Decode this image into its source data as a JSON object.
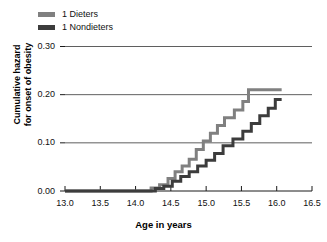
{
  "chart_data": {
    "type": "line",
    "subtype": "step",
    "title": "",
    "xlabel": "Age in years",
    "ylabel": "Cumulative hazard for onset of obesity",
    "ylabel_lines": [
      "Cumulative hazard",
      "for onset of obesity"
    ],
    "xlim": [
      13.0,
      16.5
    ],
    "ylim": [
      0.0,
      0.3
    ],
    "xticks": [
      13.0,
      13.5,
      14.0,
      14.5,
      15.0,
      15.5,
      16.0,
      16.5
    ],
    "xtick_labels": [
      "13.0",
      "13.5",
      "14.0",
      "14.5",
      "15.0",
      "15.5",
      "16.0",
      "16.5"
    ],
    "yticks": [
      0.0,
      0.1,
      0.2,
      0.3
    ],
    "ytick_labels": [
      "0.00",
      "0.10",
      "0.20",
      "0.30"
    ],
    "grid": "horizontal",
    "legend_position": "above-left",
    "series": [
      {
        "name": "1 Dieters",
        "color": "#808080",
        "points": [
          [
            13.0,
            0.0
          ],
          [
            14.22,
            0.0
          ],
          [
            14.22,
            0.006
          ],
          [
            14.34,
            0.006
          ],
          [
            14.34,
            0.013
          ],
          [
            14.46,
            0.013
          ],
          [
            14.46,
            0.026
          ],
          [
            14.56,
            0.026
          ],
          [
            14.56,
            0.04
          ],
          [
            14.66,
            0.04
          ],
          [
            14.66,
            0.052
          ],
          [
            14.76,
            0.052
          ],
          [
            14.76,
            0.066
          ],
          [
            14.86,
            0.066
          ],
          [
            14.86,
            0.086
          ],
          [
            14.96,
            0.086
          ],
          [
            14.96,
            0.104
          ],
          [
            15.06,
            0.104
          ],
          [
            15.06,
            0.12
          ],
          [
            15.16,
            0.12
          ],
          [
            15.16,
            0.136
          ],
          [
            15.26,
            0.136
          ],
          [
            15.26,
            0.152
          ],
          [
            15.4,
            0.152
          ],
          [
            15.4,
            0.168
          ],
          [
            15.52,
            0.168
          ],
          [
            15.52,
            0.186
          ],
          [
            15.6,
            0.186
          ],
          [
            15.6,
            0.21
          ],
          [
            16.07,
            0.21
          ]
        ]
      },
      {
        "name": "1 Nondieters",
        "color": "#3c3c3c",
        "points": [
          [
            13.0,
            0.0
          ],
          [
            14.28,
            0.0
          ],
          [
            14.28,
            0.005
          ],
          [
            14.4,
            0.005
          ],
          [
            14.4,
            0.01
          ],
          [
            14.52,
            0.01
          ],
          [
            14.52,
            0.02
          ],
          [
            14.64,
            0.02
          ],
          [
            14.64,
            0.03
          ],
          [
            14.76,
            0.03
          ],
          [
            14.76,
            0.04
          ],
          [
            14.88,
            0.04
          ],
          [
            14.88,
            0.052
          ],
          [
            15.0,
            0.052
          ],
          [
            15.0,
            0.064
          ],
          [
            15.12,
            0.064
          ],
          [
            15.12,
            0.078
          ],
          [
            15.24,
            0.078
          ],
          [
            15.24,
            0.094
          ],
          [
            15.38,
            0.094
          ],
          [
            15.38,
            0.108
          ],
          [
            15.52,
            0.108
          ],
          [
            15.52,
            0.124
          ],
          [
            15.64,
            0.124
          ],
          [
            15.64,
            0.14
          ],
          [
            15.76,
            0.14
          ],
          [
            15.76,
            0.156
          ],
          [
            15.88,
            0.156
          ],
          [
            15.88,
            0.172
          ],
          [
            15.98,
            0.172
          ],
          [
            15.98,
            0.19
          ],
          [
            16.07,
            0.19
          ]
        ]
      }
    ]
  }
}
